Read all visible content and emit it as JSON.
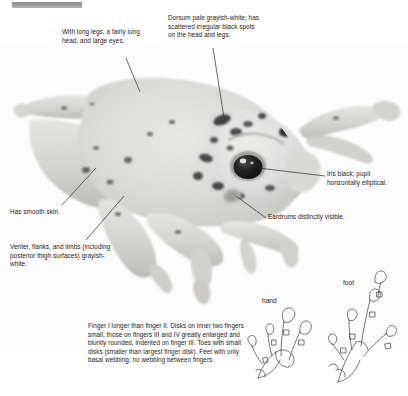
{
  "plate": {
    "width": 408,
    "height": 396,
    "background_color": "#ffffff",
    "text_color": "#1b1b1b",
    "redaction_bar_color": "#9a9a9a",
    "subject": "frog-specimen-photograph",
    "leader_line_color": "#2a2a2a"
  },
  "callouts": [
    {
      "id": "legs",
      "name": "callout-long-legs",
      "text": "With long legs, a fairly long head, and large eyes."
    },
    {
      "id": "dorsum",
      "name": "callout-dorsum-coloration",
      "text": "Dorsum pale grayish-white; has scattered irregular black spots on the head and legs."
    },
    {
      "id": "iris",
      "name": "callout-iris-pupil",
      "text": "Iris black; pupil horizontally elliptical."
    },
    {
      "id": "eardrum",
      "name": "callout-eardrums",
      "text": "Eardrums distinctly visible."
    },
    {
      "id": "skin",
      "name": "callout-smooth-skin",
      "text": "Has smooth skin."
    },
    {
      "id": "venter",
      "name": "callout-venter-coloration",
      "text": "Venter, flanks, and limbs (including posterior thigh surfaces) grayish-white."
    },
    {
      "id": "digits",
      "name": "callout-digit-morphology",
      "text": "Finger I longer than finger II. Disks on inner two fingers small, those on fingers III and IV greatly enlarged and bluntly rounded, indented on finger III. Toes with small disks (smaller than largest finger disk). Feet with only basal webbing; no webbing between fingers."
    }
  ],
  "limb_diagrams": [
    {
      "id": "hand",
      "name": "limb-label-hand",
      "label": "hand"
    },
    {
      "id": "foot",
      "name": "limb-label-foot",
      "label": "foot"
    }
  ]
}
